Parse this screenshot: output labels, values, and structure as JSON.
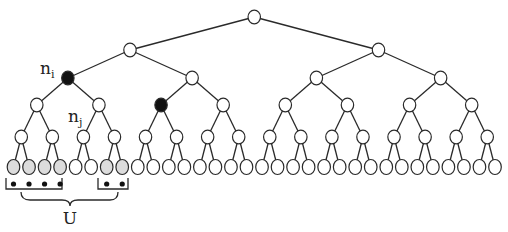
{
  "diagram": {
    "type": "complete-binary-tree",
    "depth": 5,
    "leaf_count": 32,
    "labels": {
      "n_i": {
        "base": "n",
        "sub": "i"
      },
      "n_j": {
        "base": "n",
        "sub": "j"
      },
      "U": "U"
    },
    "highlighted_nodes": [
      {
        "label": "n_i",
        "level": 2,
        "index": 0,
        "style": "filled-black"
      },
      {
        "label": "n_j",
        "level": 3,
        "index": 2,
        "style": "filled-black"
      }
    ],
    "shaded_leaves": [
      0,
      1,
      2,
      3,
      6,
      7
    ],
    "set_U": {
      "groups": [
        {
          "leaves": [
            0,
            1,
            2,
            3
          ],
          "dots": 4
        },
        {
          "leaves": [
            6,
            7
          ],
          "dots": 2
        }
      ],
      "brace_label": "U"
    },
    "colors": {
      "line": "#2a2a2a",
      "filled_node": "#111111",
      "shaded_leaf": "#dcdcdc",
      "empty_node": "#ffffff"
    }
  }
}
